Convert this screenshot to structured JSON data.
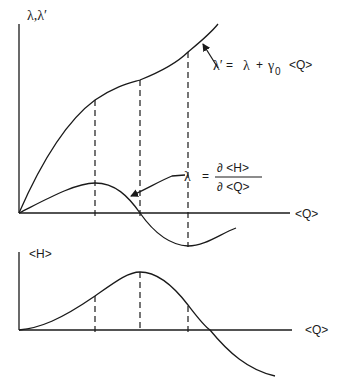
{
  "top_panel": {
    "y_axis_label": "λ,λ′",
    "x_axis_label": "<Q>",
    "lambda_prime_eq": {
      "lhs": "λ′",
      "eq": "=",
      "rhs_lambda": "λ",
      "plus": "+",
      "gamma": "γ",
      "gamma_sub": "0",
      "q": "<Q>"
    },
    "lambda_eq": {
      "lhs": "λ",
      "eq": "=",
      "numerator": "∂ <H>",
      "denominator": "∂ <Q>"
    }
  },
  "bottom_panel": {
    "y_axis_label": "<H>",
    "x_axis_label": "<Q>"
  },
  "diagram": {
    "dashed_marker_x_positions": [
      95,
      140,
      188
    ],
    "curves": [
      {
        "name": "lambda-prime",
        "description": "monotonically increasing curve, λ′ = λ + γ0<Q>"
      },
      {
        "name": "lambda",
        "description": "rises to a maximum, crosses zero at middle dashed line, minimum at right dashed line, then rises"
      },
      {
        "name": "H",
        "description": "sigmoidal rise to maximum at middle dashed line, then falls below zero"
      }
    ]
  }
}
